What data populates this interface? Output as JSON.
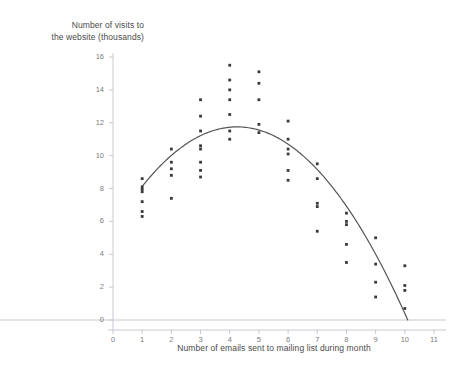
{
  "chart_data": {
    "type": "scatter",
    "title": "",
    "ylabel": "Number of visits to\nthe website (thousands)",
    "xlabel": "Number of emails sent to mailing list during month",
    "xlim": [
      0,
      11
    ],
    "ylim": [
      0,
      16
    ],
    "xticks": [
      0,
      1,
      2,
      3,
      4,
      5,
      6,
      7,
      8,
      9,
      10,
      11
    ],
    "yticks": [
      0,
      2,
      4,
      6,
      8,
      10,
      12,
      14,
      16
    ],
    "grid": false,
    "legend": null,
    "point_color": "#3a3a3a",
    "curve_color": "#555555",
    "axis_color": "#c8c8d2",
    "points": [
      {
        "x": 1,
        "y": 8.6
      },
      {
        "x": 1,
        "y": 8.1
      },
      {
        "x": 1,
        "y": 7.95
      },
      {
        "x": 1,
        "y": 7.8
      },
      {
        "x": 1,
        "y": 7.2
      },
      {
        "x": 1,
        "y": 6.6
      },
      {
        "x": 1,
        "y": 6.3
      },
      {
        "x": 2,
        "y": 10.4
      },
      {
        "x": 2,
        "y": 9.6
      },
      {
        "x": 2,
        "y": 9.2
      },
      {
        "x": 2,
        "y": 8.8
      },
      {
        "x": 2,
        "y": 7.4
      },
      {
        "x": 3,
        "y": 13.4
      },
      {
        "x": 3,
        "y": 12.4
      },
      {
        "x": 3,
        "y": 11.5
      },
      {
        "x": 3,
        "y": 10.6
      },
      {
        "x": 3,
        "y": 10.4
      },
      {
        "x": 3,
        "y": 9.6
      },
      {
        "x": 3,
        "y": 9.1
      },
      {
        "x": 3,
        "y": 8.7
      },
      {
        "x": 4,
        "y": 15.5
      },
      {
        "x": 4,
        "y": 14.6
      },
      {
        "x": 4,
        "y": 14.0
      },
      {
        "x": 4,
        "y": 13.4
      },
      {
        "x": 4,
        "y": 12.5
      },
      {
        "x": 4,
        "y": 11.5
      },
      {
        "x": 4,
        "y": 11.0
      },
      {
        "x": 5,
        "y": 15.1
      },
      {
        "x": 5,
        "y": 14.4
      },
      {
        "x": 5,
        "y": 13.4
      },
      {
        "x": 5,
        "y": 11.9
      },
      {
        "x": 5,
        "y": 11.4
      },
      {
        "x": 6,
        "y": 12.1
      },
      {
        "x": 6,
        "y": 11.0
      },
      {
        "x": 6,
        "y": 10.4
      },
      {
        "x": 6,
        "y": 10.1
      },
      {
        "x": 6,
        "y": 9.1
      },
      {
        "x": 6,
        "y": 8.5
      },
      {
        "x": 7,
        "y": 9.5
      },
      {
        "x": 7,
        "y": 8.6
      },
      {
        "x": 7,
        "y": 7.1
      },
      {
        "x": 7,
        "y": 6.9
      },
      {
        "x": 7,
        "y": 5.4
      },
      {
        "x": 8,
        "y": 6.5
      },
      {
        "x": 8,
        "y": 6.0
      },
      {
        "x": 8,
        "y": 5.8
      },
      {
        "x": 8,
        "y": 4.6
      },
      {
        "x": 8,
        "y": 3.5
      },
      {
        "x": 9,
        "y": 5.0
      },
      {
        "x": 9,
        "y": 3.4
      },
      {
        "x": 9,
        "y": 2.3
      },
      {
        "x": 9,
        "y": 1.4
      },
      {
        "x": 10,
        "y": 3.3
      },
      {
        "x": 10,
        "y": 2.1
      },
      {
        "x": 10,
        "y": 1.8
      },
      {
        "x": 10,
        "y": 0.7
      }
    ],
    "fit_curve": {
      "kind": "quadratic",
      "vertex_x": 4.25,
      "vertex_y": 11.75,
      "x_start": 1.0,
      "x_end": 10.1,
      "y_start": 7.9,
      "y_end": 0.0
    }
  }
}
